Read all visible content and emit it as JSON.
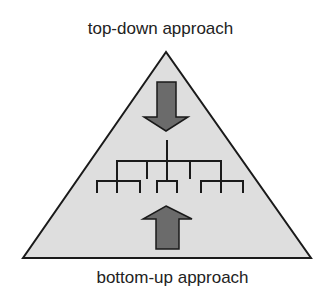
{
  "diagram": {
    "top_label": "top-down approach",
    "bottom_label": "bottom-up approach",
    "colors": {
      "triangle_fill": "#dedede",
      "outline": "#1a1a1a",
      "arrow_fill": "#6b6b6b",
      "tree_line": "#1a1a1a",
      "text": "#222222"
    },
    "elements": {
      "pyramid": "triangle",
      "top_arrow": "arrow-down-icon",
      "bottom_arrow": "arrow-up-icon",
      "hierarchy": "tree-hierarchy"
    }
  }
}
